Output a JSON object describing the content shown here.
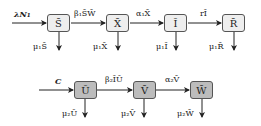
{
  "diagram": {
    "type": "compartmental-flow",
    "top_row": {
      "input": "λN₁",
      "compartments": [
        "S̄",
        "X̄",
        "Ī",
        "R̄"
      ],
      "transitions": [
        "β₁S̄W̄",
        "α₁X̄",
        "rĪ"
      ],
      "outflows": [
        "μ₁S̄",
        "μ₁X̄",
        "μ₁Ī",
        "μ₁R̄"
      ]
    },
    "bottom_row": {
      "input": "C",
      "compartments": [
        "Ū",
        "V̄",
        "W̄"
      ],
      "transitions": [
        "β₂ĪŪ",
        "α₂V̄"
      ],
      "outflows": [
        "μ₂Ū",
        "μ₂V̄",
        "μ₂W̄"
      ]
    },
    "colors": {
      "top_box_fill": "#eeeeee",
      "bottom_box_fill": "#bcbcbc",
      "stroke": "#333333"
    }
  }
}
